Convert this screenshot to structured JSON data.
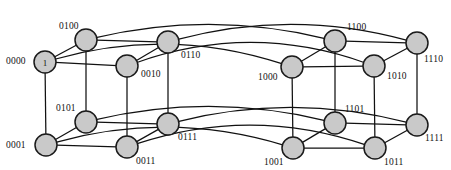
{
  "figure": {
    "kind": "hypercube-graph",
    "dimension": 4,
    "node_count": 16,
    "edge_count": 32,
    "node_fill": "#c9c9c9",
    "node_stroke": "#1a1a1a",
    "edge_stroke": "#111111",
    "background": "#ffffff",
    "node_radius": 11
  },
  "nodes": [
    {
      "id": "0000",
      "label": "0000",
      "cx": 45,
      "cy": 62,
      "inner": "1",
      "label_x": 6,
      "label_y": 57,
      "label_align": "left"
    },
    {
      "id": "0100",
      "label": "0100",
      "cx": 86,
      "cy": 40,
      "inner": "",
      "label_x": 59,
      "label_y": 22,
      "label_align": "left"
    },
    {
      "id": "0010",
      "label": "0010",
      "cx": 127,
      "cy": 66,
      "inner": "",
      "label_x": 141,
      "label_y": 70,
      "label_align": "left"
    },
    {
      "id": "0110",
      "label": "0110",
      "cx": 168,
      "cy": 42,
      "inner": "",
      "label_x": 181,
      "label_y": 51,
      "label_align": "left"
    },
    {
      "id": "0001",
      "label": "0001",
      "cx": 46,
      "cy": 145,
      "inner": "",
      "label_x": 6,
      "label_y": 141,
      "label_align": "left"
    },
    {
      "id": "0101",
      "label": "0101",
      "cx": 86,
      "cy": 122,
      "inner": "",
      "label_x": 56,
      "label_y": 104,
      "label_align": "left"
    },
    {
      "id": "0011",
      "label": "0011",
      "cx": 127,
      "cy": 147,
      "inner": "",
      "label_x": 136,
      "label_y": 157,
      "label_align": "left"
    },
    {
      "id": "0111",
      "label": "0111",
      "cx": 168,
      "cy": 124,
      "inner": "",
      "label_x": 178,
      "label_y": 133,
      "label_align": "left"
    },
    {
      "id": "1000",
      "label": "1000",
      "cx": 292,
      "cy": 67,
      "inner": "",
      "label_x": 258,
      "label_y": 73,
      "label_align": "left"
    },
    {
      "id": "1100",
      "label": "1100",
      "cx": 335,
      "cy": 41,
      "inner": "",
      "label_x": 347,
      "label_y": 23,
      "label_align": "left"
    },
    {
      "id": "1010",
      "label": "1010",
      "cx": 374,
      "cy": 66,
      "inner": "",
      "label_x": 387,
      "label_y": 72,
      "label_align": "left"
    },
    {
      "id": "1110",
      "label": "1110",
      "cx": 417,
      "cy": 43,
      "inner": "",
      "label_x": 424,
      "label_y": 55,
      "label_align": "left"
    },
    {
      "id": "1001",
      "label": "1001",
      "cx": 293,
      "cy": 148,
      "inner": "",
      "label_x": 264,
      "label_y": 158,
      "label_align": "left"
    },
    {
      "id": "1101",
      "label": "1101",
      "cx": 335,
      "cy": 123,
      "inner": "",
      "label_x": 345,
      "label_y": 105,
      "label_align": "left"
    },
    {
      "id": "1011",
      "label": "1011",
      "cx": 375,
      "cy": 148,
      "inner": "",
      "label_x": 384,
      "label_y": 158,
      "label_align": "left"
    },
    {
      "id": "1111",
      "label": "1111",
      "cx": 417,
      "cy": 125,
      "inner": "",
      "label_x": 425,
      "label_y": 134,
      "label_align": "left"
    }
  ],
  "edges_straight": [
    {
      "from": "0000",
      "to": "0100"
    },
    {
      "from": "0000",
      "to": "0010"
    },
    {
      "from": "0000",
      "to": "0001"
    },
    {
      "from": "0100",
      "to": "0110"
    },
    {
      "from": "0100",
      "to": "0101"
    },
    {
      "from": "0010",
      "to": "0110"
    },
    {
      "from": "0010",
      "to": "0011"
    },
    {
      "from": "0110",
      "to": "0111"
    },
    {
      "from": "0001",
      "to": "0101"
    },
    {
      "from": "0001",
      "to": "0011"
    },
    {
      "from": "0101",
      "to": "0111"
    },
    {
      "from": "0011",
      "to": "0111"
    },
    {
      "from": "1000",
      "to": "1100"
    },
    {
      "from": "1000",
      "to": "1010"
    },
    {
      "from": "1000",
      "to": "1001"
    },
    {
      "from": "1100",
      "to": "1110"
    },
    {
      "from": "1100",
      "to": "1101"
    },
    {
      "from": "1010",
      "to": "1110"
    },
    {
      "from": "1010",
      "to": "1011"
    },
    {
      "from": "1110",
      "to": "1111"
    },
    {
      "from": "1001",
      "to": "1101"
    },
    {
      "from": "1001",
      "to": "1011"
    },
    {
      "from": "1101",
      "to": "1111"
    },
    {
      "from": "1011",
      "to": "1111"
    }
  ],
  "edges_curved": [
    {
      "from": "0000",
      "to": "1000",
      "bow": -38
    },
    {
      "from": "0100",
      "to": "1100",
      "bow": -30
    },
    {
      "from": "0010",
      "to": "1010",
      "bow": -44
    },
    {
      "from": "0110",
      "to": "1110",
      "bow": -34
    },
    {
      "from": "0001",
      "to": "1001",
      "bow": -36
    },
    {
      "from": "0101",
      "to": "1101",
      "bow": -30
    },
    {
      "from": "0011",
      "to": "1011",
      "bow": -42
    },
    {
      "from": "0111",
      "to": "1111",
      "bow": -32
    }
  ]
}
